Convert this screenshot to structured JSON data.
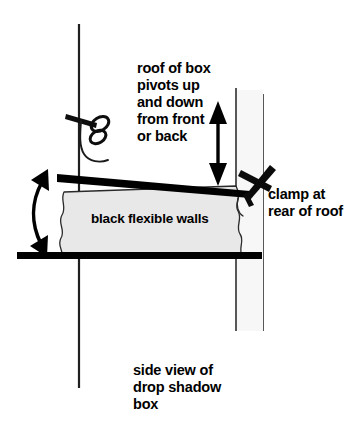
{
  "diagram": {
    "title_caption": "side view of\ndrop shadow\nbox",
    "annotations": {
      "roof_pivot": "roof of box\npivots up\nand down\nfrom front\nor back",
      "clamp_rear": "clamp at\nrear of roof",
      "flexible_walls": "black flexible walls"
    },
    "colors": {
      "ink": "#000000",
      "paper": "#ffffff",
      "walls_fill": "#e8e8e8",
      "thin_line": "#2b2b2b",
      "label_halo": "#ffffff"
    },
    "parts": [
      {
        "name": "vertical-stand-left",
        "kind": "thin-vertical-line"
      },
      {
        "name": "spring-clip-left",
        "kind": "clip"
      },
      {
        "name": "roof-bar",
        "kind": "thick-tilted-bar"
      },
      {
        "name": "base-bar",
        "kind": "thick-horizontal-bar"
      },
      {
        "name": "flexible-wall-bellows",
        "kind": "filled-wavy-body"
      },
      {
        "name": "pivot-arrow-vertical",
        "kind": "double-headed-straight-arrow"
      },
      {
        "name": "pivot-arrow-curved",
        "kind": "double-headed-curved-arrow"
      },
      {
        "name": "vertical-stand-right",
        "kind": "thin-vertical-double-line"
      },
      {
        "name": "clamp-cross-right",
        "kind": "x-cross-clamp"
      }
    ]
  }
}
